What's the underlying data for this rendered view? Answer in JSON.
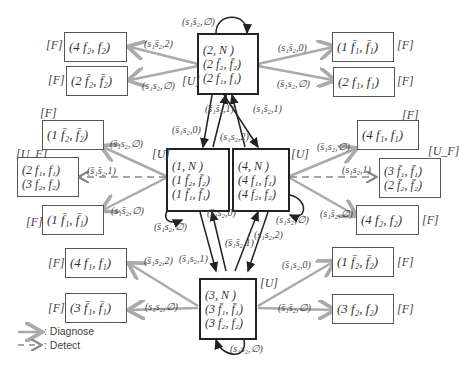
{
  "legend": {
    "diagnose": ": Diagnose",
    "detect": ": Detect"
  },
  "colors": {
    "diagnose_arrow": "#aaaaaa",
    "detect_arrow": "#888888",
    "transition_arrow": "#222222",
    "box_border": "#555555"
  },
  "states": {
    "s2": {
      "tag": "[U]",
      "lines": [
        "(2, N )",
        "(2 f̄₂, f̄₂)",
        "(2 f₁, f₁)"
      ]
    },
    "s1": {
      "tag": "[U]",
      "lines": [
        "(1, N )",
        "(1 f̄₂, f̄₂)",
        "(1 f̄₁, f̄₁)"
      ]
    },
    "s4": {
      "tag": "[U]",
      "lines": [
        "(4, N )",
        "(4 f₁, f₁)",
        "(4 f₂, f₂)"
      ]
    },
    "s3": {
      "tag": "[U]",
      "lines": [
        "(3, N )",
        "(3 f̄₁, f̄₁)",
        "(3 f₂, f₂)"
      ]
    }
  },
  "outcomes": {
    "o2a": {
      "tag": "[F]",
      "text": "(4 f₂, f₂)"
    },
    "o2b": {
      "tag": "[F]",
      "text": "(2 f̄₂, f̄₂)"
    },
    "o2c": {
      "tag": "[F]",
      "text": "(1 f̄₁, f̄₁)"
    },
    "o2d": {
      "tag": "[F]",
      "text": "(2 f₁, f₁)"
    },
    "o1a": {
      "tag": "[F]",
      "text": "(1 f̄₂, f̄₂)"
    },
    "o1b": {
      "tag": "[U_F]",
      "lines": [
        "(2 f₁, f₁)",
        "(3 f₂, f₂)"
      ]
    },
    "o1c": {
      "tag": "[F]",
      "text": "(1 f̄₁, f̄₁)"
    },
    "o4a": {
      "tag": "[F]",
      "text": "(4 f₁, f₁)"
    },
    "o4b": {
      "tag": "[U_F]",
      "lines": [
        "(3 f̄₁, f̄₁)",
        "(2 f̄₂, f̄₂)"
      ]
    },
    "o4c": {
      "tag": "[F]",
      "text": "(4 f₂, f₂)"
    },
    "o3a": {
      "tag": "[F]",
      "text": "(4 f₁, f₁)"
    },
    "o3b": {
      "tag": "[F]",
      "text": "(3 f̄₁, f̄₁)"
    },
    "o3c": {
      "tag": "[F]",
      "text": "(1 f̄₂, f̄₂)"
    },
    "o3d": {
      "tag": "[F]",
      "text": "(3 f₂, f₂)"
    }
  },
  "labels": {
    "s2_loop": "(s₁s̄₂,∅)",
    "s2_o2a": "(s₁s̄₂,2)",
    "s2_o2b": "(s₁s₂,∅)",
    "s2_o2c": "(s₁s̄₂,0)",
    "s2_o2d": "(s̄₁s₂,∅)",
    "s2_s1": "(s̄₁s₂,0)",
    "s1_s2": "(s̄₁s̄₂,1)",
    "s4_s2": "(s₁s̄₂,1)",
    "s2_s4": "(s₁s₂,2)",
    "s1_o1a": "(s̄₁s₂,∅)",
    "s1_o1b": "(s̄₁s̄₂,1)",
    "s1_o1c": "(s₁s̄₂,∅)",
    "s1_loop": "(s̄₁s₂,∅)",
    "s4_o4a": "(s̄₁s₂,∅)",
    "s4_o4b": "(s₁s₂,1)",
    "s4_o4c": "(s₁s̄₂,∅)",
    "s4_loop": "(s₁s₂,∅)",
    "s3_s1": "(s̄₁s₂,0)",
    "s1_s3": "(s̄₁s̄₂,1)",
    "s4_s3": "(s₁s₂,2)",
    "s3_o3a": "(s̄₁s₂,2)",
    "s3_in": "(s̄₁s₂,1)",
    "s3_o3b": "(s₁s₂,∅)",
    "s3_o3c": "(s̄₁s₂,0)",
    "s3_o3d": "(s̄₁s̄₂,∅)",
    "s3_loop": "(s₁s₂,∅)"
  }
}
